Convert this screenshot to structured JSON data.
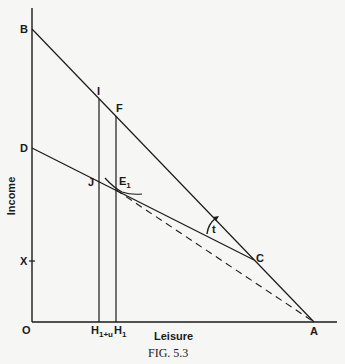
{
  "figure": {
    "caption": "FIG. 5.3",
    "x_axis_label": "Leisure",
    "y_axis_label": "Income",
    "colors": {
      "ink": "#1a1a1a",
      "background": "#f6f6f4"
    }
  },
  "points": {
    "origin": "O",
    "B": "B",
    "D": "D",
    "X": "X",
    "I": "I",
    "F": "F",
    "J": "J",
    "E1_main": "E",
    "E1_sub": "1",
    "C": "C",
    "A": "A",
    "H1u_main": "H",
    "H1u_sub": "1+u",
    "H1_main": "H",
    "H1_sub": "1",
    "angle": "t"
  },
  "lines": [
    {
      "name": "budget-line-BA",
      "from": "B",
      "to": "A",
      "style": "solid"
    },
    {
      "name": "budget-line-DC",
      "from": "D",
      "to": "C",
      "style": "solid"
    },
    {
      "name": "dashed-line-E1A",
      "from": "E1",
      "to": "A",
      "style": "dashed"
    },
    {
      "name": "vertical-H1u-I",
      "from": "H1+u",
      "to": "I",
      "style": "solid"
    },
    {
      "name": "vertical-H1-F",
      "from": "H1",
      "to": "F",
      "style": "solid"
    }
  ]
}
